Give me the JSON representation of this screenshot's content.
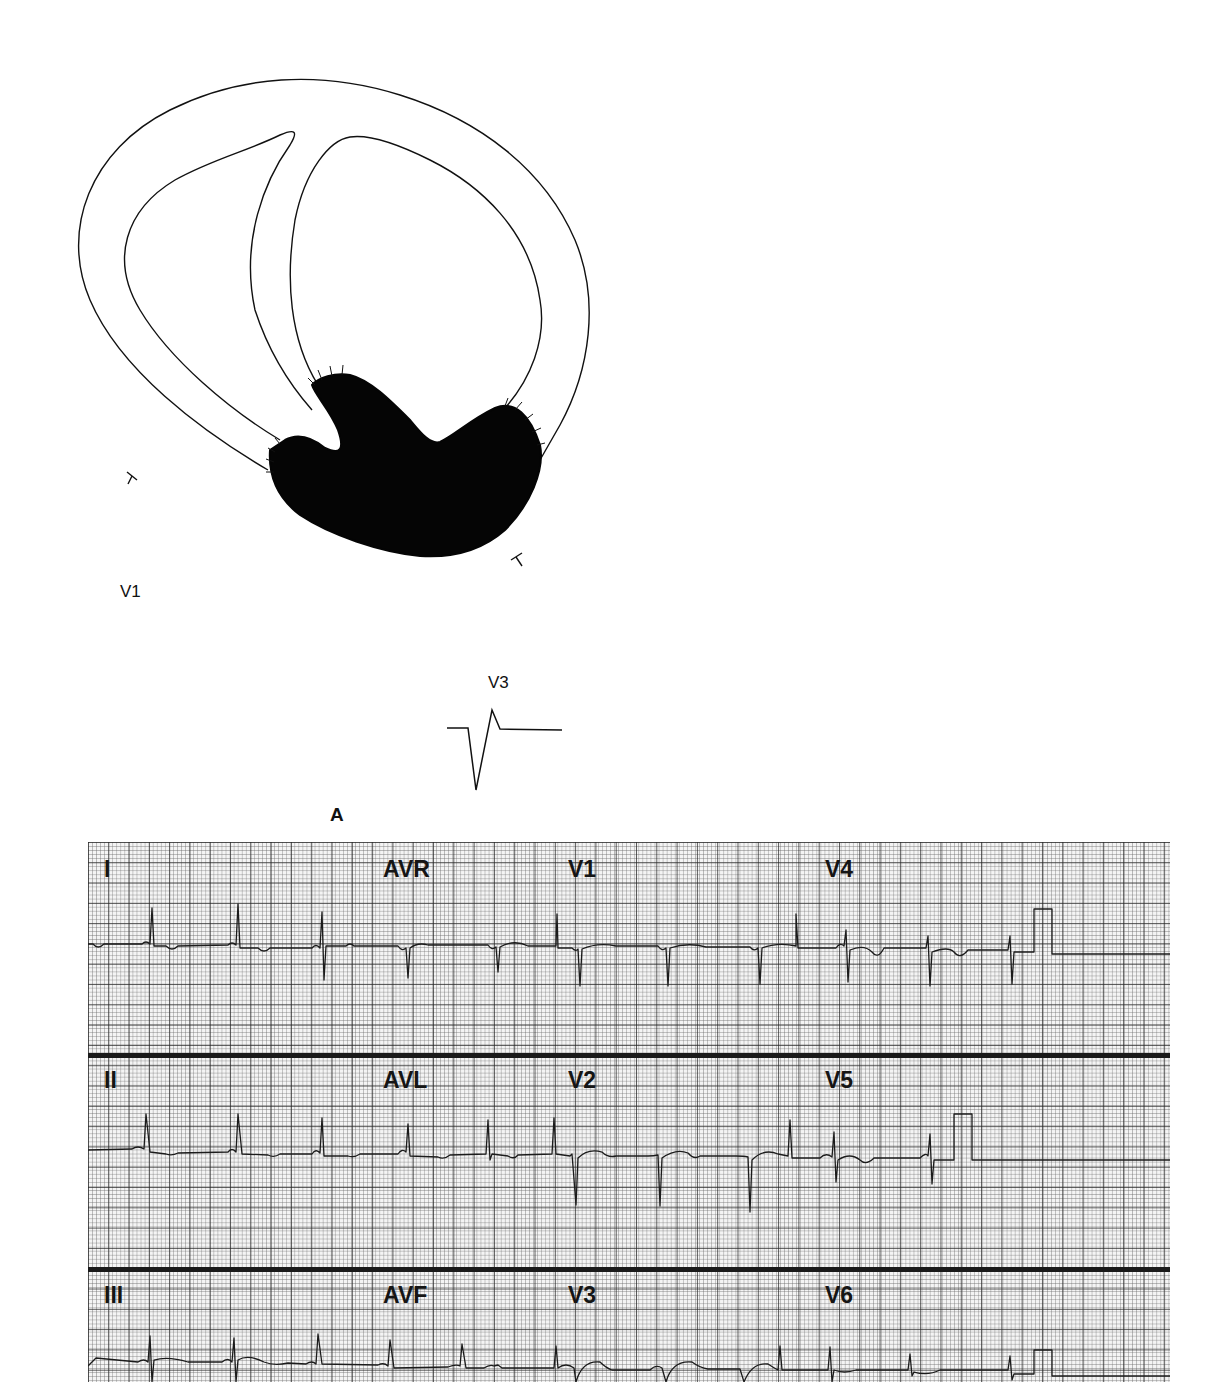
{
  "figure": {
    "panel_label": "A",
    "diagram": {
      "description": "Cross-section of heart ventricles with shaded infarct region at inferior/apical wall",
      "markers": [
        "cut-mark-left",
        "cut-mark-right"
      ]
    },
    "schematic_complexes": [
      {
        "lead": "V1",
        "shape": "QS"
      },
      {
        "lead": "V3",
        "shape": "QR"
      }
    ]
  },
  "ecg": {
    "rows": [
      {
        "labels": [
          "I",
          "AVR",
          "V1",
          "V4"
        ]
      },
      {
        "labels": [
          "II",
          "AVL",
          "V2",
          "V5"
        ]
      },
      {
        "labels": [
          "III",
          "AVF",
          "V3",
          "V6"
        ]
      }
    ],
    "grid": {
      "major_px": 20.3,
      "minor_px": 4.06,
      "paper_color": "#f4f4f4",
      "line_color": "#282828"
    },
    "calibration_pulse": true
  }
}
